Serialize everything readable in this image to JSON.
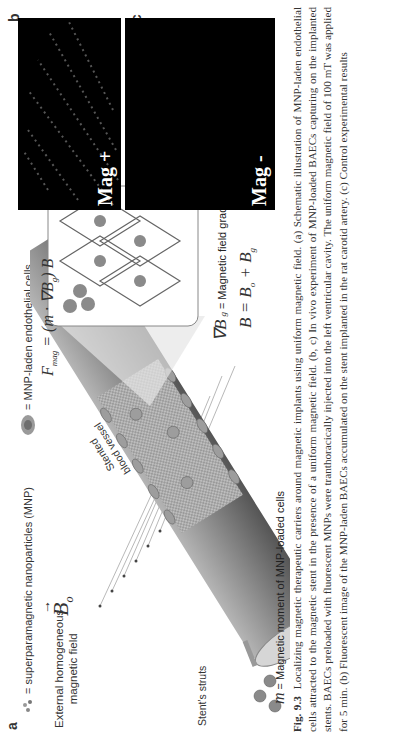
{
  "figure": {
    "panel_a": {
      "label": "a",
      "legend_mnp_symbol_text": "= superparamagnetic nanoparticles (MNP)",
      "legend_cells_symbol_text": "= MNP-laden endothelial cells",
      "external_field_label_line1": "External homogeneous",
      "external_field_label_line2": "magnetic field",
      "field_symbol": "B",
      "field_subscript": "o",
      "vessel_label_line1": "Stented",
      "vessel_label_line2": "blood vessel",
      "struts_label": "Stent's struts",
      "moment_symbol": "m",
      "moment_label": "= Magnetic moment of MNP-loaded cells",
      "force_equation": "F_mag = (m · ∇B_g) B",
      "force_equation_lhs": "F",
      "force_equation_lhs_sub": "mag",
      "force_equation_rhs": "= (m · ∇B",
      "force_equation_rhs_sub": "g",
      "force_equation_rhs_end": ") B",
      "gradient_symbol": "∇B",
      "gradient_sub": "g",
      "gradient_label": "= Magnetic field gradient",
      "total_field_equation": "B = B",
      "total_field_sub1": "o",
      "total_field_mid": " + B",
      "total_field_sub2": "g"
    },
    "panel_b": {
      "label": "b",
      "overlay_text": "Mag +"
    },
    "panel_c": {
      "label": "c",
      "overlay_text": "Mag -"
    }
  },
  "caption": {
    "figure_number": "Fig. 9.3",
    "text": "Localizing magnetic therapeutic carriers around magnetic implants using uniform magnetic field. (a) Schematic illustration of MNP-laden endothelial cells attracted to the magnetic stent in the presence of a uniform magnetic field. (b, c) In vivo experiment of MNP-loaded BAECs capturing on the implanted stents. BAECs preloaded with fluorescent MNPs were tranthoracically injected into the left ventricular cavity. The uniform magnetic field of 100 mT was applied for 5 min. (b) Fluorescent image of the MNP-laden BAECs accumulated on the stent implanted in the rat carotid artery. (c) Control experimental results"
  }
}
